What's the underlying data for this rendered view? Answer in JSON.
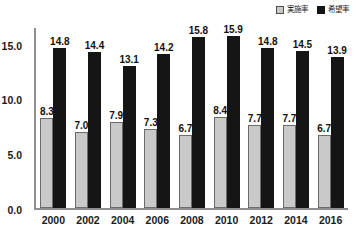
{
  "legend": {
    "position": "top-right",
    "entries": [
      {
        "label": "実施率",
        "swatch": "light-gray-square",
        "color": "#c9c9c9"
      },
      {
        "label": "希望率",
        "swatch": "black-square",
        "color": "#151515"
      }
    ]
  },
  "chart_data": {
    "type": "bar",
    "title": "",
    "subtitle": "",
    "xlabel": "",
    "ylabel": "",
    "categories": [
      "2000",
      "2002",
      "2004",
      "2006",
      "2008",
      "2010",
      "2012",
      "2014",
      "2016"
    ],
    "series": [
      {
        "name": "実施率",
        "color": "#c9c9c9",
        "values": [
          8.3,
          7.0,
          7.9,
          7.3,
          6.7,
          8.4,
          7.7,
          7.7,
          6.7
        ],
        "labels": [
          "8.3",
          "7.0",
          "7.9",
          "7.3",
          "6.7",
          "8.4",
          "7.7",
          "7.7",
          "6.7"
        ]
      },
      {
        "name": "希望率",
        "color": "#151515",
        "values": [
          14.8,
          14.4,
          13.1,
          14.2,
          15.8,
          15.9,
          14.8,
          14.5,
          13.9
        ],
        "labels": [
          "14.8",
          "14.4",
          "13.1",
          "14.2",
          "15.8",
          "15.9",
          "14.8",
          "14.5",
          "13.9"
        ]
      }
    ],
    "ylim": [
      0.0,
      16.6
    ],
    "yticks": [
      0.0,
      5.0,
      10.0,
      15.0
    ],
    "ytick_labels": [
      "0.0",
      "5.0",
      "10.0",
      "15.0"
    ],
    "grid": false,
    "legend_position": "top-right",
    "data_labels": true
  }
}
